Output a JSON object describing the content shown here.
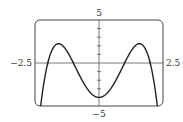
{
  "chart_data": {
    "type": "line",
    "title": "",
    "xlabel": "",
    "ylabel": "",
    "xlim": [
      -2.5,
      2.5
    ],
    "ylim": [
      -5,
      5
    ],
    "grid": false,
    "function": "-x^4 + 5x^2 - 4",
    "tick_labels": {
      "x_min": "−2.5",
      "x_max": "2.5",
      "y_max": "5",
      "y_min": "−5"
    },
    "x_ticks": [
      -2,
      -1,
      1,
      2
    ],
    "y_ticks": [
      -4,
      -3,
      -2,
      -1,
      1,
      2,
      3,
      4
    ],
    "series": [
      {
        "name": "f(x)",
        "x": [
          -2.5,
          -2.25,
          -2,
          -1.75,
          -1.5811,
          -1.5,
          -1.25,
          -1,
          -0.75,
          -0.5,
          -0.25,
          0,
          0.25,
          0.5,
          0.75,
          1,
          1.25,
          1.5,
          1.5811,
          1.75,
          2,
          2.25,
          2.5
        ],
        "values": [
          -12.31,
          -4.32,
          0,
          1.94,
          2.25,
          2.19,
          0.37,
          0,
          -1.5,
          -2.81,
          -3.69,
          -4,
          -3.69,
          -2.81,
          -1.5,
          0,
          0.37,
          2.19,
          2.25,
          1.94,
          0,
          -4.32,
          -12.31
        ]
      }
    ],
    "colors": {
      "curve": "#222222",
      "axes": "#444444",
      "frame": "#444444"
    }
  }
}
